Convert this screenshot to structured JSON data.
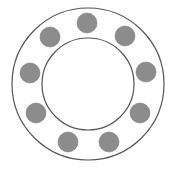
{
  "diagram": {
    "title": "",
    "colors": {
      "background": "#ffffff",
      "stroke": "#555555",
      "ball_fill": "#8c8c8c",
      "ball_stroke": "#7a7a7a"
    },
    "outer_circle": {
      "cx": 88,
      "cy": 84,
      "r": 76
    },
    "inner_circle": {
      "cx": 88,
      "cy": 84,
      "r": 46
    },
    "ball_radius": 10,
    "balls": [
      {
        "id": "top",
        "cx": 87,
        "cy": 23
      },
      {
        "id": "upper-right",
        "cx": 125,
        "cy": 36
      },
      {
        "id": "right",
        "cx": 146,
        "cy": 72
      },
      {
        "id": "lower-right",
        "cx": 140,
        "cy": 113
      },
      {
        "id": "bottom-right",
        "cx": 109,
        "cy": 142
      },
      {
        "id": "bottom-left",
        "cx": 68,
        "cy": 142
      },
      {
        "id": "lower-left",
        "cx": 36,
        "cy": 113
      },
      {
        "id": "left",
        "cx": 30,
        "cy": 73
      },
      {
        "id": "upper-left",
        "cx": 50,
        "cy": 37
      }
    ],
    "ball_count": 9
  }
}
